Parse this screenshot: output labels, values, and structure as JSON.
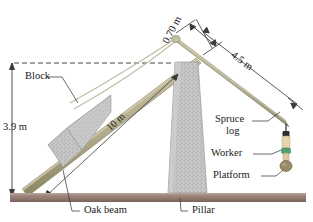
{
  "figure": {
    "background": "#ffffff"
  },
  "colors": {
    "beam_wood": "#b5ae8e",
    "beam_wood_dark": "#8e8766",
    "log_wood": "#bdb79a",
    "ground": "#9c8379",
    "ground_dark": "#7d665c",
    "block_gray": "#c6c6c6",
    "pillar_gray": "#c9c9c9",
    "rope": "#c9c3a8",
    "line": "#3a3a3a",
    "worker_skin": "#e8d2a8",
    "worker_shirt": "#4f9e78",
    "platform_brown": "#9c8b6a"
  },
  "dimensions": [
    {
      "id": "d-070",
      "label": "0.70 m",
      "rotation_deg": -64
    },
    {
      "id": "d-45",
      "label": "4.5 m",
      "rotation_deg": 36
    },
    {
      "id": "d-10",
      "label": "10 m",
      "rotation_deg": 36
    },
    {
      "id": "d-39",
      "label": "3.9 m",
      "rotation_deg": 0
    }
  ],
  "callouts": [
    {
      "id": "c-block",
      "label": "Block"
    },
    {
      "id": "c-oakbeam",
      "label": "Oak beam"
    },
    {
      "id": "c-pillar",
      "label": "Pillar"
    },
    {
      "id": "c-spruce1",
      "label": "Spruce"
    },
    {
      "id": "c-spruce2",
      "label": "log"
    },
    {
      "id": "c-worker",
      "label": "Worker"
    },
    {
      "id": "c-platform",
      "label": "Platform"
    }
  ],
  "geometry": {
    "ground_y": 196,
    "beam_low_end_x": 22,
    "beam_high_end_x": 196,
    "pivot_x": 176,
    "pivot_y": 38,
    "log_tip_x": 286,
    "log_tip_y": 126
  }
}
